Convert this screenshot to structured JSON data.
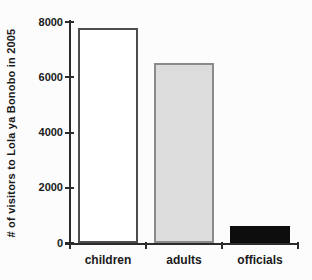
{
  "figure": {
    "background": "#fcfcfc",
    "axis_color": "#2b2b2b",
    "text_color": "#1a1a1a"
  },
  "chart_data": {
    "type": "bar",
    "title": "",
    "xlabel": "",
    "ylabel": "# of visitors to Lola ya Bonobo in 2005",
    "categories": [
      "children",
      "adults",
      "officials"
    ],
    "values": [
      7800,
      6500,
      600
    ],
    "ylim": [
      0,
      8000
    ],
    "yticks": [
      0,
      2000,
      4000,
      6000,
      8000
    ],
    "grid": false,
    "legend_position": "none",
    "bar_styles": [
      {
        "name": "children-bar",
        "fill": "#ffffff",
        "border": "#4d4d4d"
      },
      {
        "name": "adults-bar",
        "fill": "#dcdcdc",
        "border": "#8a8a8a"
      },
      {
        "name": "officials-bar",
        "fill": "#0d0d0d",
        "border": "#0d0d0d"
      }
    ]
  }
}
